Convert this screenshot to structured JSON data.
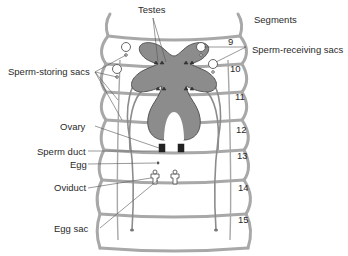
{
  "labels": {
    "testes": "Testes",
    "segments": "Segments",
    "sperm_receiving_sacs": "Sperm-receiving sacs",
    "sperm_storing_sacs": "Sperm-storing sacs",
    "ovary": "Ovary",
    "sperm_duct": "Sperm duct",
    "egg": "Egg",
    "oviduct": "Oviduct",
    "egg_sac": "Egg sac"
  },
  "segments": [
    "9",
    "10",
    "11",
    "12",
    "13",
    "14",
    "15"
  ],
  "colors": {
    "body_outline": "#a8a8a8",
    "organ_fill": "#8c8c8c",
    "organ_stroke": "#555555",
    "text": "#2a2a2a",
    "leader_line": "#555555"
  }
}
